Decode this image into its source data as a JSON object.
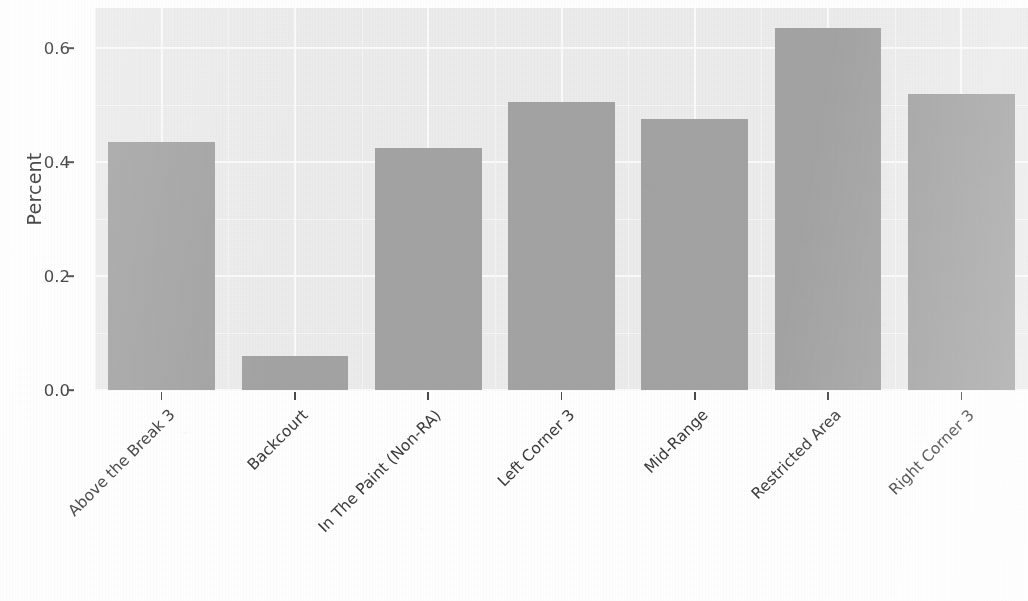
{
  "chart_data": {
    "type": "bar",
    "title": "",
    "xlabel": "",
    "ylabel": "Percent",
    "categories": [
      "Above the Break 3",
      "Backcourt",
      "In The Paint (Non-RA)",
      "Left Corner 3",
      "Mid-Range",
      "Restricted Area",
      "Right Corner 3"
    ],
    "values": [
      0.435,
      0.06,
      0.425,
      0.505,
      0.475,
      0.635,
      0.52
    ],
    "ylim": [
      0.0,
      0.67
    ],
    "yticks": [
      0.0,
      0.2,
      0.4,
      0.6
    ],
    "ytick_labels": [
      "0.0",
      "0.2",
      "0.4",
      "0.6"
    ],
    "grid": true,
    "legend": "none",
    "bar_color": "#a3a3a3",
    "panel_color": "#ececec",
    "grid_color": "#fbfbfb"
  },
  "axes": {
    "y_title": "Percent",
    "y_tick_labels": [
      "0.6",
      "0.4",
      "0.2",
      "0.0"
    ]
  },
  "notes": {
    "title_cropped": ""
  }
}
